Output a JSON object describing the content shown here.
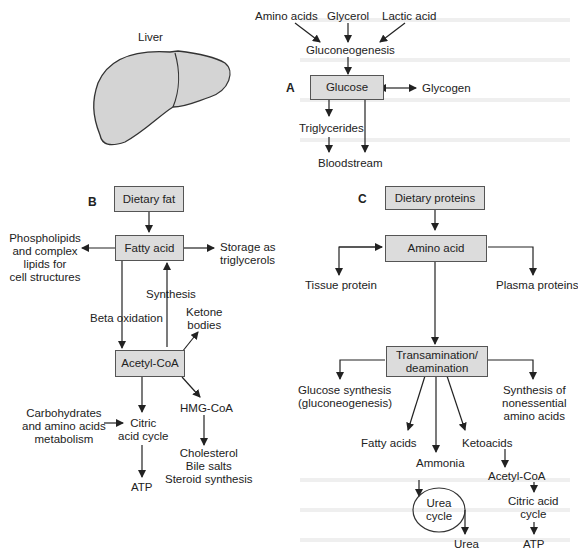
{
  "figure": {
    "liver_label": "Liver",
    "section_a": {
      "letter": "A",
      "inputs": [
        "Amino acids",
        "Glycerol",
        "Lactic acid"
      ],
      "process": "Gluconeogenesis",
      "center_box": "Glucose",
      "reversible_product": "Glycogen",
      "triglycerides": "Triglycerides",
      "bloodstream": "Bloodstream"
    },
    "section_b": {
      "letter": "B",
      "dietary_fat": "Dietary fat",
      "fatty_acid": "Fatty acid",
      "phospholipids": [
        "Phospholipids",
        "and complex",
        "lipids for",
        "cell structures"
      ],
      "storage": [
        "Storage as",
        "triglycerols"
      ],
      "synthesis": "Synthesis",
      "beta_oxidation": "Beta oxidation",
      "ketone_bodies": [
        "Ketone",
        "bodies"
      ],
      "acetyl_coa": "Acetyl-CoA",
      "carbohydrates": [
        "Carbohydrates",
        "and amino acids",
        "metabolism"
      ],
      "citric_acid_cycle": [
        "Citric",
        "acid cycle"
      ],
      "hmg_coa": "HMG-CoA",
      "cholesterol": [
        "Cholesterol",
        "Bile salts",
        "Steroid synthesis"
      ],
      "atp": "ATP"
    },
    "section_c": {
      "letter": "C",
      "dietary_proteins": "Dietary proteins",
      "amino_acid": "Amino acid",
      "tissue_protein": "Tissue protein",
      "plasma_proteins": "Plasma proteins",
      "transamination": [
        "Transamination/",
        "deamination"
      ],
      "glucose_synthesis": [
        "Glucose synthesis",
        "(gluconeogenesis)"
      ],
      "synthesis_nonessential": [
        "Synthesis of",
        "nonessential",
        "amino acids"
      ],
      "fatty_acids": "Fatty acids",
      "ketoacids": "Ketoacids",
      "ammonia": "Ammonia",
      "urea_cycle": [
        "Urea",
        "cycle"
      ],
      "urea": "Urea",
      "acetyl_coa": "Acetyl-CoA",
      "citric_acid_cycle": [
        "Citric acid",
        "cycle"
      ],
      "atp": "ATP"
    },
    "colors": {
      "box_fill": "#dcdcdc",
      "box_border": "#555555",
      "liver_fill": "#d4d4d4",
      "line": "#222222"
    }
  }
}
